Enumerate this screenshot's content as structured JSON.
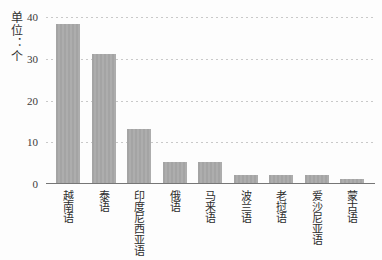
{
  "chart_data": {
    "type": "bar",
    "title": "",
    "unit_label": "单位：个",
    "categories": [
      "越南语",
      "泰语",
      "印度尼西亚语",
      "俄语",
      "马来语",
      "波兰语",
      "老挝语",
      "爱沙尼亚语",
      "蒙古语"
    ],
    "values": [
      38,
      31,
      13,
      5,
      5,
      2,
      2,
      2,
      1
    ],
    "xlabel": "",
    "ylabel": "单位：个",
    "ylim": [
      0,
      40
    ],
    "yticks": [
      0,
      10,
      20,
      30,
      40
    ],
    "grid": "horizontal dashed at 10,20,30,40",
    "legend": "none",
    "bar_color": "#a9a9a9",
    "gridline_color": "#c9c9c9",
    "axis_color": "#767676",
    "text_color": "#333333",
    "background_color": "#fdfdfd"
  }
}
